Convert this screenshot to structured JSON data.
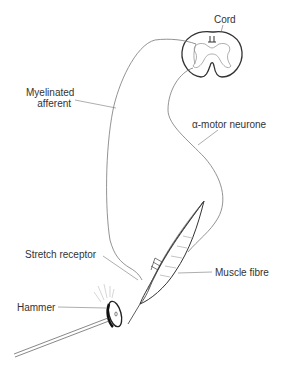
{
  "diagram": {
    "labels": {
      "cord": "Cord",
      "myelinated_afferent_line1": "Myelinated",
      "myelinated_afferent_line2": "afferent",
      "alpha_motor_neurone": "α-motor neurone",
      "stretch_receptor": "Stretch receptor",
      "muscle_fibre": "Muscle fibre",
      "hammer": "Hammer"
    },
    "colors": {
      "line": "#444444",
      "fine_line": "#888888",
      "text": "#333333",
      "background": "#ffffff"
    }
  }
}
